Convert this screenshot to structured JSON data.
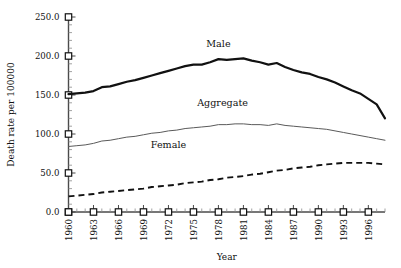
{
  "chart_data": {
    "type": "line",
    "title": "",
    "xlabel": "Year",
    "ylabel": "Death rate per 100000",
    "xlim": [
      1960,
      1998
    ],
    "ylim": [
      0,
      250
    ],
    "ytick_labels": [
      "250.0",
      "200.0",
      "150.0",
      "100.0",
      "50.0",
      "0.0"
    ],
    "ytick_values": [
      250,
      200,
      150,
      100,
      50,
      0
    ],
    "ytick_minor_step": 10,
    "xtick_labels": [
      "1960",
      "1963",
      "1966",
      "1969",
      "1972",
      "1975",
      "1978",
      "1981",
      "1984",
      "1987",
      "1990",
      "1993",
      "1996"
    ],
    "xtick_values": [
      1960,
      1963,
      1966,
      1969,
      1972,
      1975,
      1978,
      1981,
      1984,
      1987,
      1990,
      1993,
      1996
    ],
    "xtick_minor_step": 1,
    "grid": false,
    "legend_position": "inline-annotations",
    "annotations": [
      {
        "text": "Male",
        "x": 1978,
        "y": 212
      },
      {
        "text": "Aggregate",
        "x": 1978.5,
        "y": 136
      },
      {
        "text": "Female",
        "x": 1972,
        "y": 82
      }
    ],
    "series": [
      {
        "name": "Male",
        "style": "solid-thick",
        "color": "#111111",
        "x": [
          1960,
          1961,
          1962,
          1963,
          1964,
          1965,
          1966,
          1967,
          1968,
          1969,
          1970,
          1971,
          1972,
          1973,
          1974,
          1975,
          1976,
          1977,
          1978,
          1979,
          1980,
          1981,
          1982,
          1983,
          1984,
          1985,
          1986,
          1987,
          1988,
          1989,
          1990,
          1991,
          1992,
          1993,
          1994,
          1995,
          1996,
          1997,
          1998
        ],
        "y": [
          151,
          152,
          153,
          155,
          160,
          161,
          164,
          167,
          169,
          172,
          175,
          178,
          181,
          184,
          187,
          189,
          189,
          192,
          196,
          195,
          196,
          197,
          194,
          192,
          189,
          191,
          186,
          182,
          179,
          177,
          173,
          170,
          166,
          161,
          156,
          152,
          145,
          138,
          120
        ]
      },
      {
        "name": "Aggregate",
        "style": "solid-thin",
        "color": "#5a5a5a",
        "x": [
          1960,
          1961,
          1962,
          1963,
          1964,
          1965,
          1966,
          1967,
          1968,
          1969,
          1970,
          1971,
          1972,
          1973,
          1974,
          1975,
          1976,
          1977,
          1978,
          1979,
          1980,
          1981,
          1982,
          1983,
          1984,
          1985,
          1986,
          1987,
          1988,
          1989,
          1990,
          1991,
          1992,
          1993,
          1994,
          1995,
          1996,
          1997,
          1998
        ],
        "y": [
          84,
          85,
          86,
          88,
          91,
          92,
          94,
          96,
          97,
          99,
          101,
          102,
          104,
          105,
          107,
          108,
          109,
          110,
          112,
          112,
          113,
          113,
          112,
          112,
          111,
          113,
          111,
          110,
          109,
          108,
          107,
          106,
          104,
          102,
          100,
          98,
          96,
          94,
          92
        ]
      },
      {
        "name": "Female",
        "style": "dashed",
        "color": "#111111",
        "x": [
          1960,
          1961,
          1962,
          1963,
          1964,
          1965,
          1966,
          1967,
          1968,
          1969,
          1970,
          1971,
          1972,
          1973,
          1974,
          1975,
          1976,
          1977,
          1978,
          1979,
          1980,
          1981,
          1982,
          1983,
          1984,
          1985,
          1986,
          1987,
          1988,
          1989,
          1990,
          1991,
          1992,
          1993,
          1994,
          1995,
          1996,
          1997,
          1998
        ],
        "y": [
          20,
          21,
          22,
          23,
          25,
          26,
          27,
          28,
          29,
          30,
          32,
          33,
          34,
          35,
          37,
          38,
          39,
          41,
          42,
          44,
          45,
          46,
          48,
          49,
          51,
          53,
          54,
          56,
          57,
          58,
          60,
          61,
          62,
          63,
          63,
          63,
          63,
          62,
          61
        ]
      }
    ]
  }
}
